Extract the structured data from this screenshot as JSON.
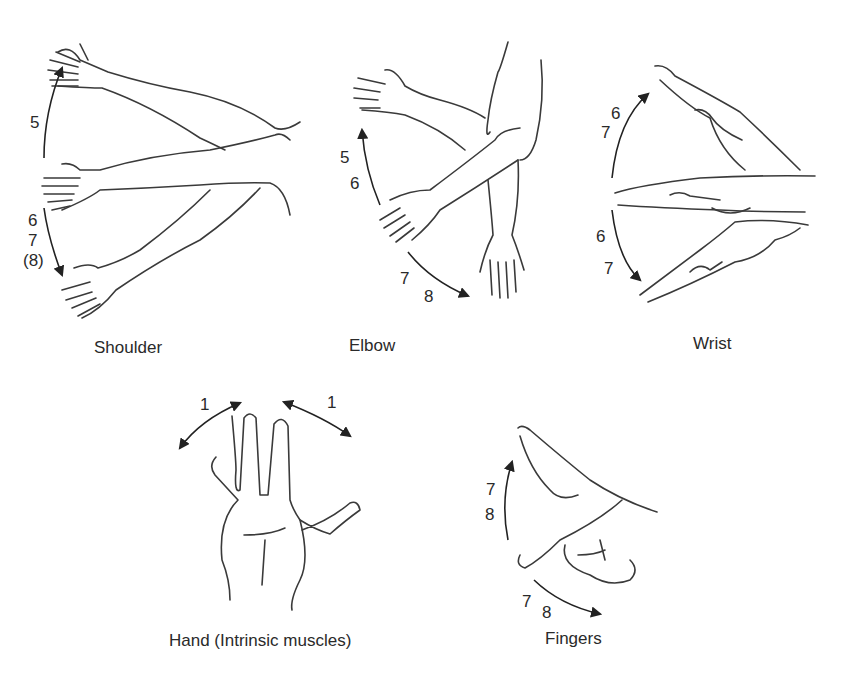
{
  "figure": {
    "panels": [
      {
        "id": "shoulder",
        "caption": "Shoulder",
        "movements": [
          {
            "direction": "up",
            "labels": [
              "5"
            ]
          },
          {
            "direction": "down",
            "labels": [
              "6",
              "7",
              "(8)"
            ]
          }
        ]
      },
      {
        "id": "elbow",
        "caption": "Elbow",
        "movements": [
          {
            "direction": "up",
            "labels": [
              "5",
              "6"
            ]
          },
          {
            "direction": "down",
            "labels": [
              "7",
              "8"
            ]
          }
        ]
      },
      {
        "id": "wrist",
        "caption": "Wrist",
        "movements": [
          {
            "direction": "up",
            "labels": [
              "6",
              "7"
            ]
          },
          {
            "direction": "down",
            "labels": [
              "6",
              "7"
            ]
          }
        ]
      },
      {
        "id": "hand",
        "caption": "Hand (Intrinsic muscles)",
        "movements": [
          {
            "direction": "left-spread",
            "labels": [
              "1"
            ]
          },
          {
            "direction": "right-spread",
            "labels": [
              "1"
            ]
          }
        ]
      },
      {
        "id": "fingers",
        "caption": "Fingers",
        "movements": [
          {
            "direction": "up",
            "labels": [
              "7",
              "8"
            ]
          },
          {
            "direction": "down",
            "labels": [
              "7",
              "8"
            ]
          }
        ]
      }
    ],
    "colors": {
      "line": "#3a3a3a",
      "text": "#2a2a2a",
      "background": "#ffffff"
    }
  }
}
